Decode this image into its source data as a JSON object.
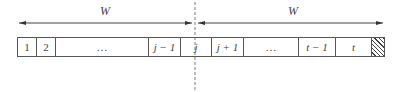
{
  "diagram": {
    "left_window": {
      "label": "W"
    },
    "right_window": {
      "label": "W"
    },
    "cells": [
      {
        "label": "1",
        "italic": false
      },
      {
        "label": "2",
        "italic": false
      },
      {
        "label": "…",
        "italic": false
      },
      {
        "label": "j − 1",
        "italic": true
      },
      {
        "label": "j",
        "italic": true
      },
      {
        "label": "j + 1",
        "italic": true
      },
      {
        "label": "…",
        "italic": false
      },
      {
        "label": "t − 1",
        "italic": true
      },
      {
        "label": "t",
        "italic": true
      },
      {
        "label": "",
        "hatched": true
      }
    ],
    "divider": {
      "style": "dashed",
      "position": "center of cell j"
    }
  }
}
